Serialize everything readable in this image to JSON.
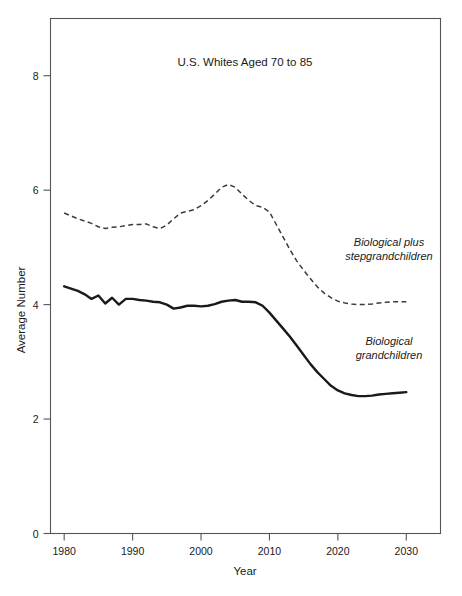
{
  "chart_data": {
    "type": "line",
    "title": "U.S. Whites Aged 70 to 85",
    "xlabel": "Year",
    "ylabel": "Average Number",
    "xlim": [
      1978,
      2035
    ],
    "ylim": [
      0,
      9
    ],
    "grid": false,
    "legend_position": "inline-annotations",
    "xticks": [
      1980,
      1990,
      2000,
      2010,
      2020,
      2030
    ],
    "xticklabels": [
      "1980",
      "1990",
      "2000",
      "2010",
      "2020",
      "2030"
    ],
    "yticks": [
      0,
      2,
      4,
      6,
      8
    ],
    "yticklabels": [
      "0",
      "2",
      "4",
      "6",
      "8"
    ],
    "series": [
      {
        "name": "Biological plus stepgrandchildren",
        "style": "dashed",
        "color": "#3a3a3a",
        "annotation_lines": [
          "Biological plus",
          "stepgrandchildren"
        ],
        "x": [
          1980,
          1981,
          1982,
          1983,
          1984,
          1985,
          1986,
          1987,
          1988,
          1989,
          1990,
          1991,
          1992,
          1993,
          1994,
          1995,
          1996,
          1997,
          1998,
          1999,
          2000,
          2001,
          2002,
          2003,
          2004,
          2005,
          2006,
          2007,
          2008,
          2009,
          2010,
          2011,
          2012,
          2013,
          2014,
          2015,
          2016,
          2017,
          2018,
          2019,
          2020,
          2021,
          2022,
          2023,
          2024,
          2025,
          2026,
          2027,
          2028,
          2029,
          2030
        ],
        "y": [
          5.6,
          5.55,
          5.5,
          5.46,
          5.42,
          5.36,
          5.33,
          5.35,
          5.36,
          5.38,
          5.4,
          5.4,
          5.41,
          5.36,
          5.33,
          5.39,
          5.5,
          5.6,
          5.63,
          5.66,
          5.73,
          5.82,
          5.93,
          6.05,
          6.1,
          6.05,
          5.93,
          5.82,
          5.73,
          5.7,
          5.62,
          5.4,
          5.18,
          4.96,
          4.76,
          4.6,
          4.45,
          4.31,
          4.2,
          4.12,
          4.06,
          4.03,
          4.01,
          4.0,
          4.0,
          4.01,
          4.03,
          4.04,
          4.05,
          4.05,
          4.05
        ]
      },
      {
        "name": "Biological grandchildren",
        "style": "solid",
        "color": "#1a1a1a",
        "annotation_lines": [
          "Biological",
          "grandchildren"
        ],
        "x": [
          1980,
          1981,
          1982,
          1983,
          1984,
          1985,
          1986,
          1987,
          1988,
          1989,
          1990,
          1991,
          1992,
          1993,
          1994,
          1995,
          1996,
          1997,
          1998,
          1999,
          2000,
          2001,
          2002,
          2003,
          2004,
          2005,
          2006,
          2007,
          2008,
          2009,
          2010,
          2011,
          2012,
          2013,
          2014,
          2015,
          2016,
          2017,
          2018,
          2019,
          2020,
          2021,
          2022,
          2023,
          2024,
          2025,
          2026,
          2027,
          2028,
          2029,
          2030
        ],
        "y": [
          4.32,
          4.28,
          4.24,
          4.18,
          4.1,
          4.16,
          4.02,
          4.12,
          4.0,
          4.1,
          4.1,
          4.08,
          4.07,
          4.05,
          4.04,
          4.0,
          3.93,
          3.95,
          3.98,
          3.98,
          3.97,
          3.98,
          4.01,
          4.05,
          4.07,
          4.08,
          4.05,
          4.05,
          4.04,
          3.98,
          3.86,
          3.72,
          3.58,
          3.44,
          3.28,
          3.12,
          2.96,
          2.82,
          2.7,
          2.58,
          2.5,
          2.45,
          2.42,
          2.4,
          2.4,
          2.41,
          2.43,
          2.44,
          2.45,
          2.46,
          2.47
        ]
      }
    ]
  },
  "axes": {
    "y_axis_label": "Average Number",
    "x_axis_label": "Year"
  },
  "title": "U.S. Whites Aged 70 to 85"
}
